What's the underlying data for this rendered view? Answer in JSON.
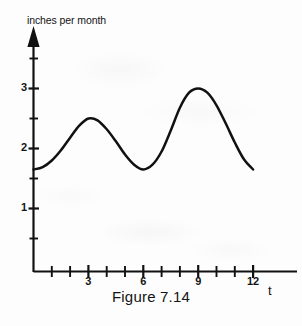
{
  "figure": {
    "caption": "Figure 7.14",
    "y_axis_title": "inches per month",
    "x_axis_title": "t"
  },
  "chart_data": {
    "type": "line",
    "title": "Figure 7.14",
    "xlabel": "t",
    "ylabel": "inches per month",
    "xlim": [
      0,
      13.2
    ],
    "ylim": [
      0,
      3.9
    ],
    "grid": false,
    "legend": null,
    "axis_style": "arrow-headed axes, origin at lower left",
    "x_ticks_major": [
      3,
      6,
      9,
      12
    ],
    "x_tick_labels": [
      "3",
      "6",
      "9",
      "12"
    ],
    "x_ticks_minor": [
      1,
      2,
      4,
      5,
      7,
      8,
      10,
      11
    ],
    "y_ticks_major": [
      1,
      2,
      3
    ],
    "y_tick_labels": [
      "1",
      "2",
      "3"
    ],
    "y_ticks_minor": [
      0.5,
      1.5,
      2.5,
      3.5
    ],
    "series": [
      {
        "name": "rainfall",
        "x": [
          0,
          0.5,
          1,
          1.5,
          2,
          2.5,
          3,
          3.5,
          4,
          4.5,
          5,
          5.5,
          6,
          6.5,
          7,
          7.5,
          8,
          8.5,
          9,
          9.5,
          10,
          10.5,
          11,
          11.5,
          12
        ],
        "values": [
          1.65,
          1.69,
          1.8,
          1.97,
          2.18,
          2.38,
          2.5,
          2.47,
          2.32,
          2.12,
          1.9,
          1.73,
          1.65,
          1.73,
          1.95,
          2.3,
          2.68,
          2.93,
          3.0,
          2.93,
          2.72,
          2.42,
          2.1,
          1.82,
          1.65
        ]
      }
    ],
    "annotations": [
      {
        "label": "first peak",
        "x": 3,
        "y": 2.5
      },
      {
        "label": "trough",
        "x": 6,
        "y": 1.65
      },
      {
        "label": "second peak",
        "x": 9,
        "y": 3.0
      }
    ],
    "colors": {
      "curve": "#111111",
      "axis": "#111111",
      "background": "#fdfdfd"
    }
  }
}
